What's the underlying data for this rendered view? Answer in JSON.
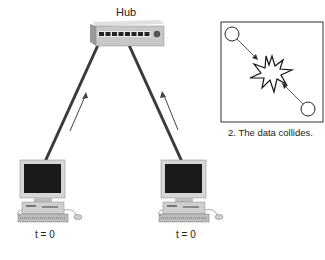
{
  "hub": {
    "label": "Hub",
    "port_count": 8
  },
  "computers": [
    {
      "id": "left",
      "time_label": "t = 0"
    },
    {
      "id": "right",
      "time_label": "t = 0"
    }
  ],
  "inset": {
    "caption": "2. The data collides."
  },
  "colors": {
    "cable": "#3a3a3a",
    "hub_body": "#c8c8c8",
    "screen": "#1a1a1a",
    "case": "#cfcfcf"
  }
}
